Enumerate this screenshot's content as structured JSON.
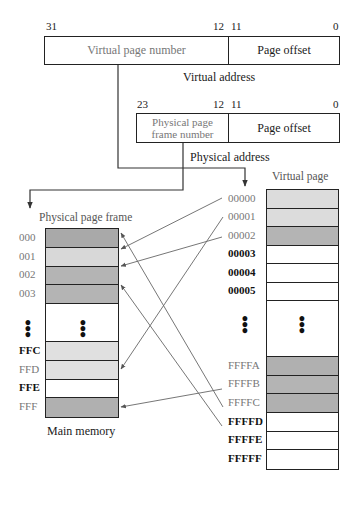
{
  "virtual_address": {
    "bits": {
      "high": "31",
      "mid_high": "12",
      "mid_low": "11",
      "low": "0"
    },
    "fields": {
      "page_number": "Virtual page number",
      "offset": "Page offset"
    },
    "caption": "Virtual address"
  },
  "physical_address": {
    "bits": {
      "high": "23",
      "mid_high": "12",
      "mid_low": "11",
      "low": "0"
    },
    "fields": {
      "frame_number_line1": "Physical page",
      "frame_number_line2": "frame number",
      "offset": "Page offset"
    },
    "caption": "Physical address"
  },
  "physical_memory": {
    "title": "Physical page frame",
    "caption": "Main memory",
    "rows": [
      {
        "label": "000",
        "fill": "#a9a9a9",
        "label_style": "gray"
      },
      {
        "label": "001",
        "fill": "#d8d8d8",
        "label_style": "gray"
      },
      {
        "label": "002",
        "fill": "#b4b4b4",
        "label_style": "gray"
      },
      {
        "label": "003",
        "fill": "#b4b4b4",
        "label_style": "gray"
      },
      {
        "label": "ellipsis",
        "fill": "#ffffff"
      },
      {
        "label": "FFC",
        "fill": "#e0e0e0",
        "label_style": "dark"
      },
      {
        "label": "FFD",
        "fill": "#e0e0e0",
        "label_style": "gray"
      },
      {
        "label": "FFE",
        "fill": "#ffffff",
        "label_style": "dark"
      },
      {
        "label": "FFF",
        "fill": "#b0b0b0",
        "label_style": "gray"
      }
    ]
  },
  "virtual_memory": {
    "title": "Virtual page",
    "rows": [
      {
        "label": "00000",
        "fill": "#dcdcdc",
        "label_style": "gray"
      },
      {
        "label": "00001",
        "fill": "#dcdcdc",
        "label_style": "gray"
      },
      {
        "label": "00002",
        "fill": "#b4b4b4",
        "label_style": "gray"
      },
      {
        "label": "00003",
        "fill": "#ffffff",
        "label_style": "dark"
      },
      {
        "label": "00004",
        "fill": "#ffffff",
        "label_style": "dark"
      },
      {
        "label": "00005",
        "fill": "#ffffff",
        "label_style": "dark"
      },
      {
        "label": "ellipsis",
        "fill": "#ffffff"
      },
      {
        "label": "FFFFA",
        "fill": "#b0b0b0",
        "label_style": "gray"
      },
      {
        "label": "FFFFB",
        "fill": "#b4b4b4",
        "label_style": "gray"
      },
      {
        "label": "FFFFC",
        "fill": "#b0b0b0",
        "label_style": "gray"
      },
      {
        "label": "FFFFD",
        "fill": "#ffffff",
        "label_style": "dark"
      },
      {
        "label": "FFFFE",
        "fill": "#ffffff",
        "label_style": "dark"
      },
      {
        "label": "FFFFF",
        "fill": "#ffffff",
        "label_style": "dark"
      }
    ]
  },
  "mappings": [
    {
      "virtual": "00000",
      "physical": "001"
    },
    {
      "virtual": "00001",
      "physical": "FFD"
    },
    {
      "virtual": "00002",
      "physical": "002"
    },
    {
      "virtual": "FFFFA",
      "physical": "FFF"
    },
    {
      "virtual": "FFFFB",
      "physical": "000"
    },
    {
      "virtual": "FFFFC",
      "physical": "003"
    }
  ],
  "colors": {
    "line": "#222222",
    "arrow": "#666666",
    "label_gray": "#777777"
  }
}
